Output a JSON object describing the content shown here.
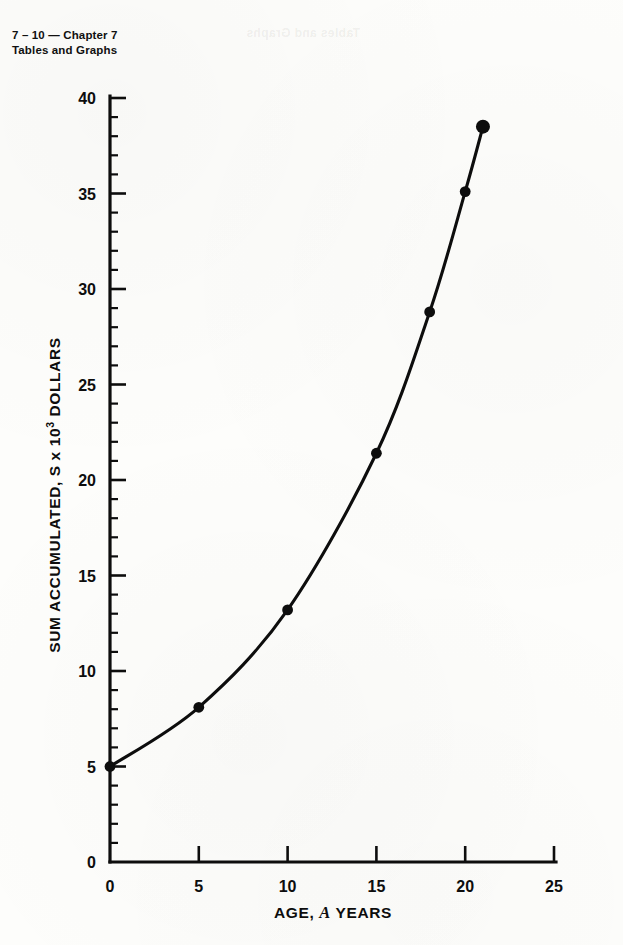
{
  "page": {
    "header_line1": "7 – 10 — Chapter 7",
    "header_line2": "Tables and Graphs",
    "bleed_through_text": "Tables and Graphs"
  },
  "chart_data": {
    "type": "line",
    "title": "",
    "subtitle": "",
    "xlabel_prefix": "AGE,",
    "xlabel_symbol": "A",
    "xlabel_suffix": "YEARS",
    "xlabel": "AGE, A YEARS",
    "ylabel_prefix": "SUM ACCUMULATED, S x 10",
    "ylabel_exponent": "3",
    "ylabel_suffix": " DOLLARS",
    "ylabel": "SUM ACCUMULATED, S x 10^3 DOLLARS",
    "xlim": [
      0,
      25
    ],
    "ylim": [
      0,
      40
    ],
    "x_ticks": [
      0,
      5,
      10,
      15,
      20,
      25
    ],
    "x_tick_labels": [
      "0",
      "5",
      "10",
      "15",
      "20",
      "25"
    ],
    "x_minor_step": 0,
    "y_ticks": [
      0,
      5,
      10,
      15,
      20,
      25,
      30,
      35,
      40
    ],
    "y_tick_labels": [
      "0",
      "5",
      "10",
      "15",
      "20",
      "25",
      "30",
      "35",
      "40"
    ],
    "y_minor_step": 1,
    "grid": false,
    "legend": false,
    "legend_position": "none",
    "marker_style": "filled-circle",
    "line_color": "#0d0d0d",
    "marker_color": "#0d0d0d",
    "x": [
      0,
      5,
      10,
      15,
      18,
      20,
      21
    ],
    "values": [
      5.0,
      8.1,
      13.2,
      21.4,
      28.8,
      35.1,
      38.5
    ],
    "points": [
      {
        "x": 0,
        "y": 5.0,
        "marker_size": "normal"
      },
      {
        "x": 5,
        "y": 8.1,
        "marker_size": "normal"
      },
      {
        "x": 10,
        "y": 13.2,
        "marker_size": "normal"
      },
      {
        "x": 15,
        "y": 21.4,
        "marker_size": "normal"
      },
      {
        "x": 18,
        "y": 28.8,
        "marker_size": "normal"
      },
      {
        "x": 20,
        "y": 35.1,
        "marker_size": "normal"
      },
      {
        "x": 21,
        "y": 38.5,
        "marker_size": "large"
      }
    ]
  }
}
